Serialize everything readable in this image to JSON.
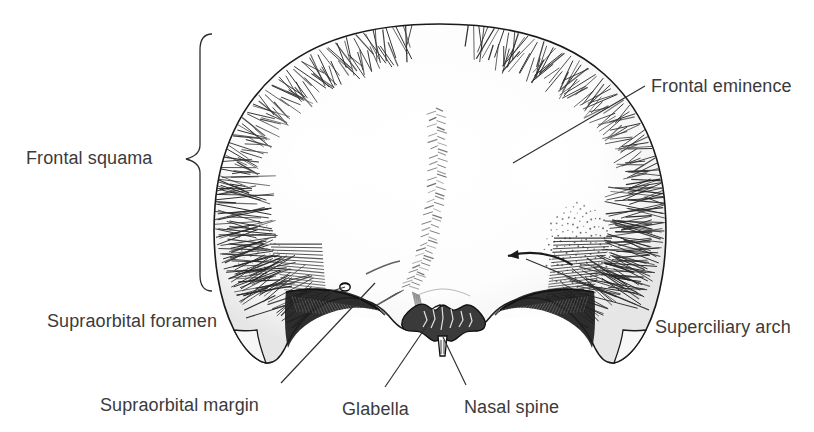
{
  "figure": {
    "background_color": "#ffffff",
    "ink_color": "#1c1c1c",
    "label_color": "#3b3b3b",
    "width": 814,
    "height": 432
  },
  "labels": [
    {
      "id": "frontal-squama",
      "text": "Frontal squama",
      "x": 26,
      "y": 149,
      "anchor": "left",
      "connector": "brace"
    },
    {
      "id": "frontal-eminence",
      "text": "Frontal eminence",
      "x": 651,
      "y": 77,
      "anchor": "left",
      "connector": "line"
    },
    {
      "id": "superciliary-arch",
      "text": "Superciliary arch",
      "x": 655,
      "y": 318,
      "anchor": "left",
      "connector": "line"
    },
    {
      "id": "supraorbital-foramen",
      "text": "Supraorbital foramen",
      "x": 47,
      "y": 312,
      "anchor": "left",
      "connector": "line"
    },
    {
      "id": "supraorbital-margin",
      "text": "Supraorbital margin",
      "x": 100,
      "y": 396,
      "anchor": "left",
      "connector": "line"
    },
    {
      "id": "glabella",
      "text": "Glabella",
      "x": 342,
      "y": 400,
      "anchor": "left",
      "connector": "line"
    },
    {
      "id": "nasal-spine",
      "text": "Nasal spine",
      "x": 464,
      "y": 398,
      "anchor": "left",
      "connector": "line"
    }
  ],
  "brace": {
    "id": "frontal-squama-brace",
    "top_y": 34,
    "bottom_y": 291,
    "spine_x": 200,
    "tip_x": 186,
    "tip_y": 159
  },
  "leaders": [
    {
      "id": "leader-frontal-eminence",
      "from": [
        645,
        86
      ],
      "to": [
        513,
        163
      ]
    },
    {
      "id": "leader-superciliary-arch",
      "from": [
        649,
        310
      ],
      "to": [
        526,
        259
      ]
    },
    {
      "id": "leader-supraorbital-foramen",
      "from": [
        246,
        318
      ],
      "to": [
        345,
        287
      ]
    },
    {
      "id": "leader-supraorbital-margin",
      "from": [
        281,
        383
      ],
      "to": [
        375,
        283
      ]
    },
    {
      "id": "leader-glabella",
      "from": [
        385,
        387
      ],
      "to": [
        432,
        318
      ]
    },
    {
      "id": "leader-nasal-spine",
      "from": [
        466,
        385
      ],
      "to": [
        443,
        337
      ]
    }
  ]
}
